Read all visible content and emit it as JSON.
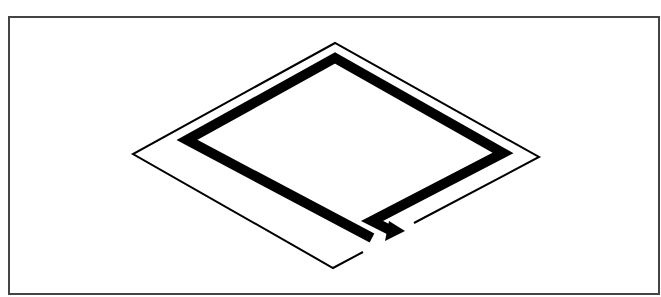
{
  "diagram": {
    "type": "isometric-coil",
    "colors": {
      "stroke": "#000000",
      "frame": "#444444",
      "background": "#ffffff"
    },
    "frame": {
      "x": 9,
      "y": 17,
      "width": 650,
      "height": 277
    },
    "outer_thin_path": "M363,252 L333,268 L133,154 L335,43 L539,157 L414,223",
    "inner_thick_path": "M372,238 L187,140 L335,58 L503,153 L372,221 L392,231",
    "arrowhead_points": "386,238 404,230 392,222 396,226 389,235"
  }
}
